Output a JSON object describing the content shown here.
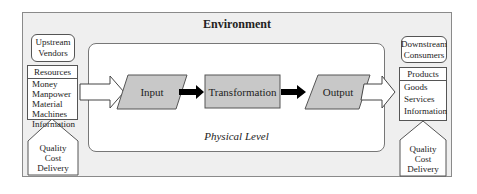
{
  "environment": {
    "title": "Environment"
  },
  "physical_level": {
    "label": "Physical Level"
  },
  "left": {
    "supplier": {
      "line1": "Upstream",
      "line2": "Vendors"
    },
    "resources": {
      "header": "Resources",
      "items": [
        "Money",
        "Manpower",
        "Material",
        "Machines",
        "Information"
      ]
    },
    "qcd": {
      "items": [
        "Quality",
        "Cost",
        "Delivery"
      ]
    }
  },
  "right": {
    "customer": {
      "line1": "Downstream",
      "line2": "Consumers"
    },
    "products": {
      "header": "Products",
      "items": [
        "Goods",
        "Services",
        "Information"
      ]
    },
    "qcd": {
      "items": [
        "Quality",
        "Cost",
        "Delivery"
      ]
    }
  },
  "process": {
    "input": "Input",
    "transformation": "Transformation",
    "output": "Output"
  },
  "colors": {
    "environment_bg": "#efefef",
    "process_fill": "#c8c8c8",
    "arrow_dark": "#000000"
  }
}
